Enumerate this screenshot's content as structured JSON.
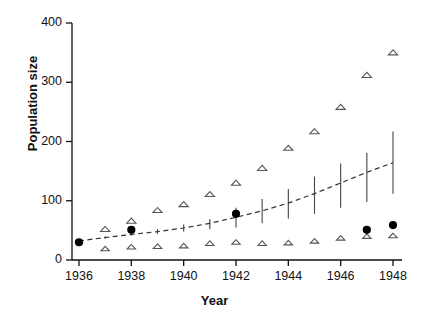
{
  "chart_data": {
    "type": "scatter",
    "title": "",
    "xlabel": "Year",
    "ylabel": "Population size",
    "xlim": [
      1936,
      1948
    ],
    "ylim": [
      0,
      400
    ],
    "xticks": [
      1936,
      1938,
      1940,
      1942,
      1944,
      1946,
      1948
    ],
    "xtick_labels": [
      "1936",
      "1938",
      "1940",
      "1942",
      "1944",
      "1946",
      "1948"
    ],
    "yticks": [
      0,
      100,
      200,
      300,
      400
    ],
    "ytick_labels": [
      "0",
      "100",
      "200",
      "300",
      "400"
    ],
    "grid": false,
    "legend": null,
    "x": [
      1936,
      1937,
      1938,
      1939,
      1940,
      1941,
      1942,
      1943,
      1944,
      1945,
      1946,
      1947,
      1948
    ],
    "series": [
      {
        "name": "Observed upper bound",
        "marker": "open-triangle",
        "color": "#555555",
        "x": [
          1937,
          1938,
          1939,
          1940,
          1941,
          1942,
          1943,
          1944,
          1945,
          1946,
          1947,
          1948
        ],
        "values": [
          52,
          66,
          84,
          94,
          111,
          130,
          155,
          189,
          217,
          258,
          312,
          350
        ]
      },
      {
        "name": "Observed lower bound",
        "marker": "open-triangle",
        "color": "#555555",
        "x": [
          1937,
          1938,
          1939,
          1940,
          1941,
          1942,
          1943,
          1944,
          1945,
          1946,
          1947,
          1948
        ],
        "values": [
          19,
          22,
          23,
          24,
          28,
          30,
          28,
          29,
          32,
          37,
          40,
          41
        ]
      },
      {
        "name": "Census estimate",
        "marker": "filled-circle",
        "color": "#000000",
        "x": [
          1936,
          1938,
          1942,
          1947,
          1948
        ],
        "values": [
          30,
          51,
          78,
          51,
          59
        ]
      },
      {
        "name": "Model fit",
        "marker": "dashed-line",
        "color": "#333333",
        "x": [
          1936,
          1937,
          1938,
          1939,
          1940,
          1941,
          1942,
          1943,
          1944,
          1945,
          1946,
          1947,
          1948
        ],
        "values": [
          32,
          38,
          43,
          48,
          54,
          62,
          72,
          83,
          96,
          112,
          130,
          148,
          164
        ]
      },
      {
        "name": "Confidence interval",
        "marker": "error-bar",
        "color": "#444444",
        "x": [
          1936,
          1937,
          1938,
          1939,
          1940,
          1941,
          1942,
          1943,
          1944,
          1945,
          1946,
          1947,
          1948
        ],
        "low": [
          32,
          36,
          41,
          44,
          48,
          52,
          55,
          62,
          70,
          78,
          88,
          98,
          112
        ],
        "high": [
          32,
          40,
          46,
          52,
          60,
          69,
          88,
          103,
          120,
          141,
          163,
          181,
          217
        ]
      }
    ]
  }
}
